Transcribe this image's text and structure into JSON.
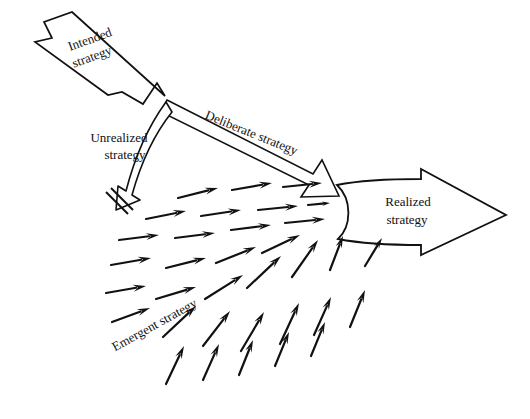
{
  "figure": {
    "background_color": "#ffffff",
    "stroke_color": "#111111"
  },
  "labels": {
    "intended": {
      "line1": "Intended",
      "line2": "strategy",
      "rotation_deg": -20
    },
    "deliberate": {
      "text": "Deliberate strategy",
      "rotation_deg": 22
    },
    "unrealized": {
      "line1": "Unrealized",
      "line2": "strategy",
      "rotation_deg": 0
    },
    "emergent": {
      "text": "Emergent strategy",
      "rotation_deg": -29
    },
    "realized": {
      "line1": "Realized",
      "line2": "strategy",
      "rotation_deg": 0
    }
  },
  "shapes": {
    "intended_arrow": {
      "name": "intended-strategy-arrow",
      "style": "thick-hollow-block-arrow",
      "direction": "down-right",
      "points": "72,12 165,96 157,83 143,104 122,92 108,95 35,42 52,38 44,22"
    },
    "deliberate_arrow": {
      "name": "deliberate-strategy-arrow",
      "style": "thin-outline-arrow",
      "direction": "down-right",
      "points": "167,101 318,174 325,162 338,195 303,196 311,186 161,113"
    },
    "unrealized_arrow": {
      "name": "unrealized-strategy-arrow",
      "style": "curved-hollow-arrow",
      "direction": "curve-down-left-to-stop",
      "path": "M163,103 C146,128 134,160 127,190 L119,186 L117,208 L139,199 L133,195 C140,166 152,136 169,112 Z"
    },
    "unrealized_stop_bar": {
      "name": "unrealized-stop-bar",
      "line_a": "106,192 128,214",
      "line_b": "110,188 132,210"
    },
    "realized_arrow": {
      "name": "realized-strategy-arrow",
      "style": "thick-hollow-block-arrow",
      "direction": "right",
      "path": "M338,186 C370,181 394,180 421,180 L421,170 L505,215 L421,254 L421,244 C394,244 368,243 338,238 C350,228 352,198 338,186 Z"
    }
  },
  "emergent_field": {
    "name": "emergent-strategy-arrows",
    "converge_point": [
      336,
      224
    ],
    "arrow_count": 34,
    "arrows": [
      {
        "x1": 178,
        "y1": 198,
        "x2": 218,
        "y2": 188
      },
      {
        "x1": 232,
        "y1": 190,
        "x2": 272,
        "y2": 183
      },
      {
        "x1": 283,
        "y1": 187,
        "x2": 322,
        "y2": 183
      },
      {
        "x1": 146,
        "y1": 219,
        "x2": 186,
        "y2": 211
      },
      {
        "x1": 201,
        "y1": 216,
        "x2": 241,
        "y2": 210
      },
      {
        "x1": 258,
        "y1": 210,
        "x2": 298,
        "y2": 206
      },
      {
        "x1": 308,
        "y1": 205,
        "x2": 330,
        "y2": 203
      },
      {
        "x1": 119,
        "y1": 240,
        "x2": 159,
        "y2": 235
      },
      {
        "x1": 175,
        "y1": 238,
        "x2": 215,
        "y2": 233
      },
      {
        "x1": 231,
        "y1": 230,
        "x2": 271,
        "y2": 225
      },
      {
        "x1": 285,
        "y1": 223,
        "x2": 325,
        "y2": 219
      },
      {
        "x1": 111,
        "y1": 265,
        "x2": 151,
        "y2": 258
      },
      {
        "x1": 166,
        "y1": 268,
        "x2": 206,
        "y2": 258
      },
      {
        "x1": 216,
        "y1": 263,
        "x2": 256,
        "y2": 247
      },
      {
        "x1": 262,
        "y1": 253,
        "x2": 300,
        "y2": 235
      },
      {
        "x1": 106,
        "y1": 293,
        "x2": 146,
        "y2": 286
      },
      {
        "x1": 156,
        "y1": 299,
        "x2": 196,
        "y2": 287
      },
      {
        "x1": 205,
        "y1": 299,
        "x2": 243,
        "y2": 275
      },
      {
        "x1": 247,
        "y1": 288,
        "x2": 281,
        "y2": 256
      },
      {
        "x1": 292,
        "y1": 277,
        "x2": 318,
        "y2": 240
      },
      {
        "x1": 330,
        "y1": 270,
        "x2": 343,
        "y2": 236
      },
      {
        "x1": 365,
        "y1": 266,
        "x2": 382,
        "y2": 238
      },
      {
        "x1": 112,
        "y1": 322,
        "x2": 150,
        "y2": 308
      },
      {
        "x1": 163,
        "y1": 337,
        "x2": 196,
        "y2": 306
      },
      {
        "x1": 203,
        "y1": 346,
        "x2": 230,
        "y2": 311
      },
      {
        "x1": 241,
        "y1": 351,
        "x2": 264,
        "y2": 312
      },
      {
        "x1": 280,
        "y1": 344,
        "x2": 299,
        "y2": 303
      },
      {
        "x1": 314,
        "y1": 335,
        "x2": 331,
        "y2": 297
      },
      {
        "x1": 350,
        "y1": 327,
        "x2": 365,
        "y2": 290
      },
      {
        "x1": 166,
        "y1": 384,
        "x2": 184,
        "y2": 346
      },
      {
        "x1": 203,
        "y1": 380,
        "x2": 219,
        "y2": 344
      },
      {
        "x1": 239,
        "y1": 375,
        "x2": 253,
        "y2": 340
      },
      {
        "x1": 275,
        "y1": 366,
        "x2": 289,
        "y2": 332
      },
      {
        "x1": 311,
        "y1": 356,
        "x2": 325,
        "y2": 322
      }
    ]
  }
}
